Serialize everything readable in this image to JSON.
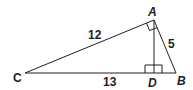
{
  "diagram": {
    "type": "right-triangle-with-altitude",
    "vertices": {
      "A": "A",
      "B": "B",
      "C": "C",
      "D": "D"
    },
    "side_labels": {
      "AC": "12",
      "AB": "5",
      "CD": "13"
    },
    "right_angles": [
      "A",
      "D"
    ],
    "colors": {
      "line": "#231f20",
      "background": "#ffffff"
    }
  }
}
